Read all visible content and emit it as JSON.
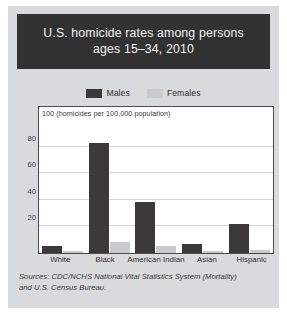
{
  "title": "U.S. homicide rates among persons\nages 15–34, 2010",
  "legend": {
    "males_label": "Males",
    "females_label": "Females",
    "males_color": "#3b393a",
    "females_color": "#c9cacb"
  },
  "source_note": "Sources: CDC/NCHS National Vital Statistics System (Mortality)\nand U.S. Census Bureau.",
  "colors": {
    "card_background": "#d9dadb",
    "title_banner": "#333233",
    "title_text": "#f2f2f2",
    "plot_background": "#ffffff",
    "plot_border": "#4a4a4a",
    "gridline": "#d5d5d5",
    "text": "#2e2d2e"
  },
  "chart_data": {
    "type": "bar",
    "title": "U.S. homicide rates among persons ages 15–34, 2010",
    "xlabel": "",
    "ylabel": "100 (homicides per 100,000 population)",
    "ylim": [
      0,
      100
    ],
    "yticks": [
      20,
      40,
      60,
      80,
      100
    ],
    "ytick_labels": [
      "20",
      "40",
      "60",
      "80",
      "100"
    ],
    "grid": true,
    "legend_position": "top-center",
    "categories": [
      "White",
      "Black",
      "American Indian",
      "Asian",
      "Hispanic"
    ],
    "series": [
      {
        "name": "Males",
        "color": "#3b393a",
        "values": [
          5,
          83,
          38,
          7,
          22
        ]
      },
      {
        "name": "Females",
        "color": "#c9cacb",
        "values": [
          1.5,
          8,
          5,
          1.5,
          2
        ]
      }
    ]
  }
}
